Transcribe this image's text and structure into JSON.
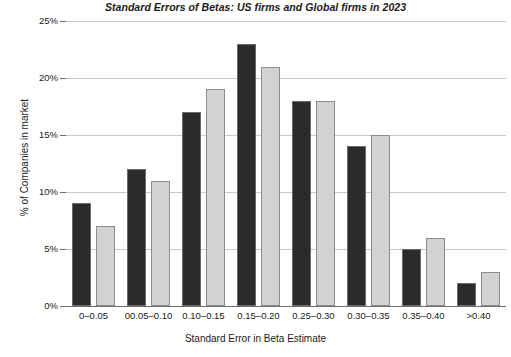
{
  "chart_data": {
    "type": "bar",
    "title": "Standard Errors of Betas: US firms and Global firms in 2023",
    "xlabel": "Standard Error in Beta Estimate",
    "ylabel": "% of Companies in market",
    "categories": [
      "0–0.05",
      "00.05–0.10",
      "0.10–0.15",
      "0.15–0.20",
      "0.25–0.30",
      "0.30–0.35",
      "0.35–0.40",
      ">0.40"
    ],
    "series": [
      {
        "name": "US firms",
        "color": "#2b2b2b",
        "values": [
          9,
          12,
          17,
          23,
          18,
          14,
          5,
          2
        ]
      },
      {
        "name": "Global firms",
        "color": "#d2d2d2",
        "values": [
          7,
          11,
          19,
          21,
          18,
          15,
          6,
          3
        ]
      }
    ],
    "ylim": [
      0,
      25
    ],
    "yticks": [
      0,
      5,
      10,
      15,
      20,
      25
    ],
    "ytick_labels": [
      "0%",
      "5%",
      "10%",
      "15%",
      "20%",
      "25%"
    ],
    "grid": true,
    "legend": "none"
  }
}
